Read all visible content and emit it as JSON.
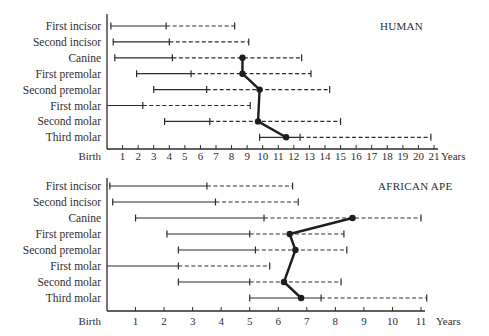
{
  "chart_data": [
    {
      "type": "range-bar",
      "title": "HUMAN",
      "xlabel": "Years",
      "x_ticks": [
        "Birth",
        "1",
        "2",
        "3",
        "4",
        "5",
        "6",
        "7",
        "8",
        "9",
        "10",
        "11",
        "12",
        "13",
        "14",
        "15",
        "16",
        "17",
        "18",
        "19",
        "20",
        "21"
      ],
      "xlim": [
        0,
        21
      ],
      "legend": "solid line = crown formation; dashed line = root formation; dot = eruption (connected)",
      "categories": [
        "First incisor",
        "Second incisor",
        "Canine",
        "First premolar",
        "Second premolar",
        "First molar",
        "Second molar",
        "Third molar"
      ],
      "bars": [
        {
          "tooth": "First incisor",
          "start": 0.25,
          "mid": 3.8,
          "end": 8.2,
          "eruption": null
        },
        {
          "tooth": "Second incisor",
          "start": 0.4,
          "mid": 4.0,
          "end": 9.1,
          "eruption": null
        },
        {
          "tooth": "Canine",
          "start": 0.5,
          "mid": 4.2,
          "end": 12.5,
          "eruption": 8.7
        },
        {
          "tooth": "First premolar",
          "start": 1.9,
          "mid": 5.4,
          "end": 13.1,
          "eruption": 8.7
        },
        {
          "tooth": "Second premolar",
          "start": 3.0,
          "mid": 6.4,
          "end": 14.3,
          "eruption": 9.8
        },
        {
          "tooth": "First molar",
          "start": 0,
          "mid": 2.3,
          "end": 9.2,
          "eruption": null,
          "no_start_cap": true
        },
        {
          "tooth": "Second molar",
          "start": 3.7,
          "mid": 6.6,
          "end": 15.0,
          "eruption": 9.7
        },
        {
          "tooth": "Third molar",
          "start": 9.8,
          "mid": 12.4,
          "end": 20.8,
          "eruption": 11.5
        }
      ]
    },
    {
      "type": "range-bar",
      "title": "AFRICAN APE",
      "xlabel": "Years",
      "x_ticks": [
        "Birth",
        "1",
        "2",
        "3",
        "4",
        "5",
        "6",
        "7",
        "8",
        "9",
        "10",
        "11"
      ],
      "xlim": [
        0,
        11
      ],
      "categories": [
        "First incisor",
        "Second incisor",
        "Canine",
        "First premolar",
        "Second premolar",
        "First molar",
        "Second molar",
        "Third molar"
      ],
      "bars": [
        {
          "tooth": "First incisor",
          "start": 0.1,
          "mid": 3.5,
          "end": 6.5,
          "eruption": null
        },
        {
          "tooth": "Second incisor",
          "start": 0.2,
          "mid": 3.8,
          "end": 6.7,
          "eruption": null
        },
        {
          "tooth": "Canine",
          "start": 1.0,
          "mid": 5.5,
          "end": 11.0,
          "eruption": 8.6
        },
        {
          "tooth": "First premolar",
          "start": 2.1,
          "mid": 5.0,
          "end": 8.3,
          "eruption": 6.4
        },
        {
          "tooth": "Second premolar",
          "start": 2.5,
          "mid": 5.2,
          "end": 8.4,
          "eruption": 6.6
        },
        {
          "tooth": "First molar",
          "start": 0,
          "mid": 2.5,
          "end": 5.7,
          "eruption": null,
          "no_start_cap": true
        },
        {
          "tooth": "Second molar",
          "start": 2.5,
          "mid": 5.0,
          "end": 8.2,
          "eruption": 6.2
        },
        {
          "tooth": "Third molar",
          "start": 5.0,
          "mid": 7.5,
          "end": 11.2,
          "eruption": 6.8
        }
      ]
    }
  ],
  "panels": [
    {
      "title": "HUMAN",
      "axis_label": "Years"
    },
    {
      "title": "AFRICAN APE",
      "axis_label": "Years"
    }
  ]
}
